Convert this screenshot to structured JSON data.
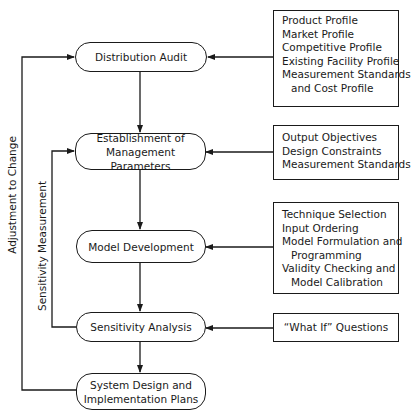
{
  "diagram": {
    "process_steps": [
      {
        "id": "distribution-audit",
        "lines": [
          "Distribution Audit"
        ]
      },
      {
        "id": "management-parameters",
        "lines": [
          "Establishment of",
          "Management Parameters"
        ]
      },
      {
        "id": "model-development",
        "lines": [
          "Model Development"
        ]
      },
      {
        "id": "sensitivity-analysis",
        "lines": [
          "Sensitivity Analysis"
        ]
      },
      {
        "id": "system-design",
        "lines": [
          "System Design and",
          "Implementation Plans"
        ]
      }
    ],
    "input_boxes": [
      {
        "target": "distribution-audit",
        "items": [
          "Product Profile",
          "Market Profile",
          "Competitive Profile",
          "Existing Facility Profile",
          "Measurement Standards",
          "and Cost Profile"
        ]
      },
      {
        "target": "management-parameters",
        "items": [
          "Output Objectives",
          "Design Constraints",
          "Measurement Standards"
        ]
      },
      {
        "target": "model-development",
        "items": [
          "Technique Selection",
          "Input Ordering",
          "Model Formulation and",
          "Programming",
          "Validity Checking and",
          "Model Calibration"
        ]
      },
      {
        "target": "sensitivity-analysis",
        "items": [
          "“What If” Questions"
        ]
      }
    ],
    "feedback_loops": [
      {
        "label": "Adjustment to Change",
        "from": "system-design",
        "to": "distribution-audit"
      },
      {
        "label": "Sensitivity Measurement",
        "from": "sensitivity-analysis",
        "to": "management-parameters"
      }
    ]
  }
}
